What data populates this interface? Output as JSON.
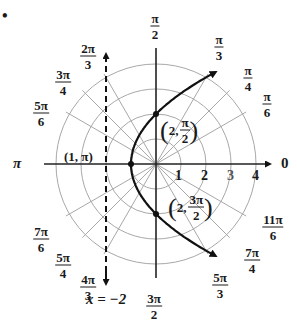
{
  "figure": {
    "bullet": "•",
    "center_px": [
      156,
      164
    ],
    "unit_px": 25,
    "grid_color": "#a8a8a8",
    "curve_color": "#111111",
    "rings": [
      1,
      2,
      3,
      4
    ],
    "ring_labels": [
      "1",
      "2",
      "3",
      "4"
    ],
    "angle_labels": [
      {
        "id": "0",
        "text": "0"
      },
      {
        "id": "pi_6",
        "num": "π",
        "den": "6"
      },
      {
        "id": "pi_4",
        "num": "π",
        "den": "4"
      },
      {
        "id": "pi_3",
        "num": "π",
        "den": "3"
      },
      {
        "id": "pi_2",
        "num": "π",
        "den": "2"
      },
      {
        "id": "2pi_3",
        "num": "2π",
        "den": "3"
      },
      {
        "id": "3pi_4",
        "num": "3π",
        "den": "4"
      },
      {
        "id": "5pi_6",
        "num": "5π",
        "den": "6"
      },
      {
        "id": "pi",
        "text": "π"
      },
      {
        "id": "7pi_6",
        "num": "7π",
        "den": "6"
      },
      {
        "id": "5pi_4",
        "num": "5π",
        "den": "4"
      },
      {
        "id": "4pi_3",
        "num": "4π",
        "den": "3"
      },
      {
        "id": "3pi_2",
        "num": "3π",
        "den": "2"
      },
      {
        "id": "5pi_3",
        "num": "5π",
        "den": "3"
      },
      {
        "id": "7pi_4",
        "num": "7π",
        "den": "4"
      },
      {
        "id": "11pi_6",
        "num": "11π",
        "den": "6"
      }
    ],
    "points": [
      {
        "label": "(1, π)",
        "r": 1,
        "theta": "π"
      },
      {
        "label_prefix": "2,",
        "num": "π",
        "den": "2",
        "r": 2,
        "theta": "π/2"
      },
      {
        "label_prefix": "2,",
        "num": "3π",
        "den": "2",
        "r": 2,
        "theta": "3π/2"
      }
    ],
    "directrix": {
      "label": "x = −2",
      "x": -2,
      "style": "dashed"
    },
    "curve": {
      "equation": "r = 2/(1 − cos θ)",
      "type": "parabola"
    }
  }
}
